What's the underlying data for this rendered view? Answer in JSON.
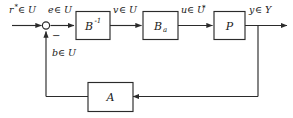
{
  "diagram": {
    "type": "control-system-block-diagram",
    "background_color": "#ffffff",
    "line_color": "#2b2b2b",
    "blocks": [
      {
        "id": "b-inverse",
        "label": "B",
        "superscript": "-1",
        "subscript": ""
      },
      {
        "id": "b-a",
        "label": "B",
        "superscript": "",
        "subscript": "a"
      },
      {
        "id": "plant",
        "label": "P",
        "superscript": "",
        "subscript": ""
      },
      {
        "id": "a-block",
        "label": "A",
        "superscript": "",
        "subscript": ""
      }
    ],
    "signals": [
      {
        "id": "reference",
        "text": "r",
        "superscript": "*",
        "set": "∈ U"
      },
      {
        "id": "error",
        "text": "e",
        "superscript": "",
        "set": "∈ U"
      },
      {
        "id": "v-signal",
        "text": "v",
        "superscript": "",
        "set": "∈ U"
      },
      {
        "id": "u-signal",
        "text": "u",
        "superscript": "",
        "set": "∈ U",
        "set_superscript": "*"
      },
      {
        "id": "output",
        "text": "y",
        "superscript": "",
        "set": "∈ Y"
      },
      {
        "id": "feedback",
        "text": "b",
        "superscript": "",
        "set": "∈ U"
      }
    ],
    "summing_junction": {
      "id": "summing-junction",
      "feedback_sign": "−"
    }
  }
}
